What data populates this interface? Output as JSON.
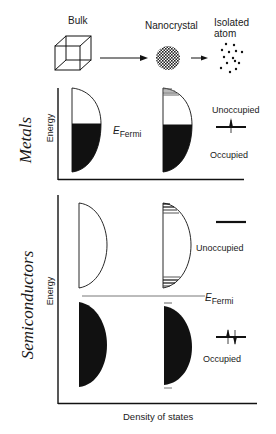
{
  "top": {
    "bulk_label": "Bulk",
    "nanocrystal_label": "Nanocrystal",
    "atom_label_line1": "Isolated",
    "atom_label_line2": "atom"
  },
  "metals": {
    "section_label": "Metals",
    "y_axis_label": "Energy",
    "fermi_label_main": "E",
    "fermi_label_sub": "Fermi",
    "unoccupied_label": "Unoccupied",
    "occupied_label": "Occupied"
  },
  "semiconductors": {
    "section_label": "Semiconductors",
    "y_axis_label": "Energy",
    "fermi_label_main": "E",
    "fermi_label_sub": "Fermi",
    "unoccupied_label": "Unoccupied",
    "occupied_label": "Occupied"
  },
  "x_axis_label": "Density of states",
  "colors": {
    "ink": "#111111",
    "background": "#ffffff"
  }
}
